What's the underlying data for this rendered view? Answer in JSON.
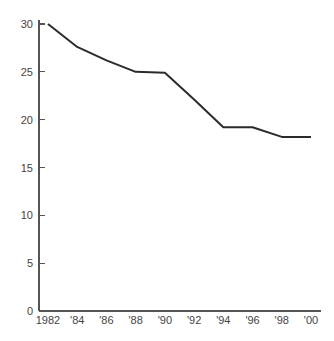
{
  "chart_data": {
    "type": "line",
    "title": "",
    "subtitle": "",
    "xlabel": "",
    "ylabel": "",
    "x": [
      1982,
      1984,
      1986,
      1988,
      1990,
      1992,
      1994,
      1996,
      1998,
      2000
    ],
    "x_tick_labels": [
      "1982",
      "'84",
      "'86",
      "'88",
      "'90",
      "'92",
      "'94",
      "'96",
      "'98",
      "'00"
    ],
    "y_tick_labels": [
      "0",
      "5",
      "10",
      "15",
      "20",
      "25",
      "30"
    ],
    "y_ticks": [
      0,
      5,
      10,
      15,
      20,
      25,
      30
    ],
    "xlim": [
      1982,
      2000
    ],
    "ylim": [
      0,
      30
    ],
    "grid": false,
    "legend": false,
    "series": [
      {
        "name": "series-1",
        "color": "#2b2b2b",
        "values": [
          30.0,
          27.6,
          26.2,
          25.0,
          24.9,
          22.1,
          19.2,
          19.2,
          18.2,
          18.2
        ]
      }
    ]
  },
  "axes": {
    "y_axis_name": "y-axis",
    "x_axis_name": "x-axis"
  }
}
